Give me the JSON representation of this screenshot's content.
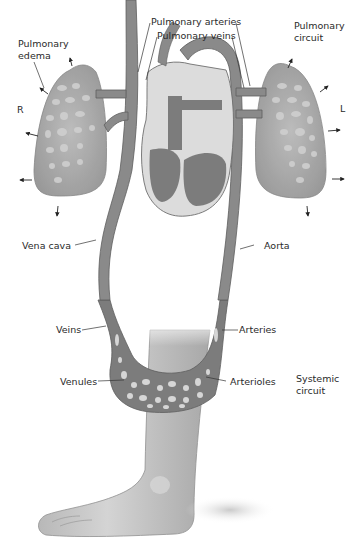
{
  "diagram": {
    "style": "grayscale anatomical illustration",
    "colors": {
      "vessel": "#8a8a8a",
      "vessel_dark": "#6e6e6e",
      "vessel_light": "#d8d8d8",
      "lung": "#9a9a9a",
      "skin": "#c9c9c9",
      "skin_shadow": "#a9a9a9",
      "text": "#2a2a2a",
      "background": "#ffffff"
    },
    "labels": {
      "pulmonary_edema": "Pulmonary\nedema",
      "pulmonary_arteries": "Pulmonary arteries",
      "pulmonary_veins": "Pulmonary veins",
      "pulmonary_circuit": "Pulmonary\ncircuit",
      "right_side": "R",
      "left_side": "L",
      "vena_cava": "Vena cava",
      "aorta": "Aorta",
      "veins": "Veins",
      "arteries": "Arteries",
      "venules": "Venules",
      "arterioles": "Arterioles",
      "systemic_circuit": "Systemic\ncircuit"
    },
    "structures": [
      "right-lung",
      "left-lung",
      "heart",
      "vena-cava",
      "aorta",
      "pulmonary-arteries",
      "pulmonary-veins",
      "capillary-bed-leg",
      "lower-leg",
      "foot"
    ],
    "arrows": {
      "meaning": "fluid leaking outward from lungs (pulmonary edema)",
      "right_lung_count": 5,
      "left_lung_count": 5
    }
  }
}
